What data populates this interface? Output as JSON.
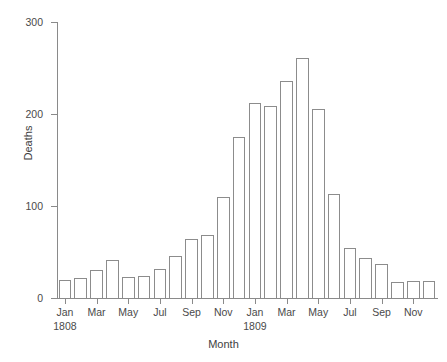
{
  "chart_data": {
    "type": "bar",
    "title": "",
    "xlabel": "Month",
    "ylabel": "Deaths",
    "ylim": [
      0,
      300
    ],
    "yticks": [
      0,
      100,
      200,
      300
    ],
    "ytick_labels": [
      "0",
      "100",
      "200",
      "300"
    ],
    "grid": false,
    "legend": "none",
    "xtick_labels": [
      "Jan",
      "Mar",
      "May",
      "Jul",
      "Sep",
      "Nov",
      "Jan",
      "Mar",
      "May",
      "Jul",
      "Sep",
      "Nov"
    ],
    "year_labels": [
      "1808",
      "1809"
    ],
    "categories": [
      "Jan 1808",
      "Feb 1808",
      "Mar 1808",
      "Apr 1808",
      "May 1808",
      "Jun 1808",
      "Jul 1808",
      "Aug 1808",
      "Sep 1808",
      "Oct 1808",
      "Nov 1808",
      "Dec 1808",
      "Jan 1809",
      "Feb 1809",
      "Mar 1809",
      "Apr 1809",
      "May 1809",
      "Jun 1809",
      "Jul 1809",
      "Aug 1809",
      "Sep 1809",
      "Oct 1809",
      "Nov 1809",
      "Dec 1809"
    ],
    "values": [
      20,
      22,
      30,
      41,
      23,
      24,
      32,
      46,
      64,
      69,
      110,
      175,
      212,
      209,
      236,
      261,
      205,
      113,
      54,
      44,
      37,
      17,
      18,
      18
    ],
    "bar_color": "#ffffff",
    "bar_edge_color": "#8c8c8c",
    "axis_color": "#8a8a8a",
    "text_color": "#3e3e3e"
  }
}
